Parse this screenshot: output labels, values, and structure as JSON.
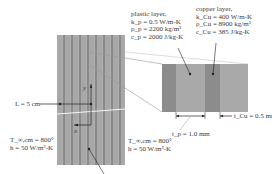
{
  "diagram": {
    "plastic_layer": {
      "title": "plastic layer,",
      "k": "k_p = 0.5 W/m-K",
      "rho": "ρ_p = 2200 kg/m³",
      "c": "c_p = 2000 J/kg-K"
    },
    "copper_layer": {
      "title": "copper layer,",
      "k": "k_Cu = 400 W/m-K",
      "rho": "ρ_Cu = 8900 kg/m³",
      "c": "c_Cu = 385 J/kg-K"
    },
    "length_label": "L = 5 cm",
    "axis_y": "y",
    "axis_x": "x",
    "left_boundary": {
      "T": "T_∞,cm = 800°",
      "h": "h = 50 W/m²-K"
    },
    "right_boundary": {
      "T": "T_∞,cm = 800°",
      "h": "h = 50 W/m²-K"
    },
    "t_p_label": "t_p = 1.0 mm",
    "t_cu_label": "t_Cu = 0.5 mm",
    "colors": {
      "plastic": "#a9a9a9",
      "copper": "#8c8c8c",
      "line": "#222222"
    }
  }
}
